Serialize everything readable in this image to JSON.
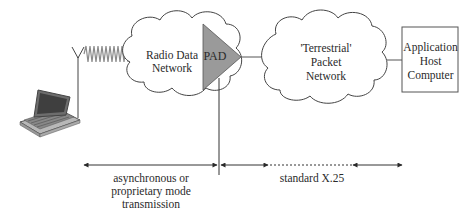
{
  "diagram": {
    "nodes": {
      "mobile_terminal": {
        "kind": "laptop-with-antenna"
      },
      "radio_data_network": {
        "label_line1": "Radio Data",
        "label_line2": "Network"
      },
      "pad": {
        "label": "PAD"
      },
      "terrestrial_network": {
        "label_line1": "'Terrestrial'",
        "label_line2": "Packet",
        "label_line3": "Network"
      },
      "application_host": {
        "label_line1": "Application",
        "label_line2": "Host",
        "label_line3": "Computer"
      }
    },
    "spans": {
      "left": {
        "label_line1": "asynchronous or",
        "label_line2": "proprietary mode",
        "label_line3": "transmission"
      },
      "right": {
        "label": "standard X.25"
      }
    },
    "colors": {
      "line": "#3a3a3a",
      "pad_fill": "#9a9a9a",
      "wave": "#8a8a8a",
      "box_border": "#555555"
    }
  }
}
